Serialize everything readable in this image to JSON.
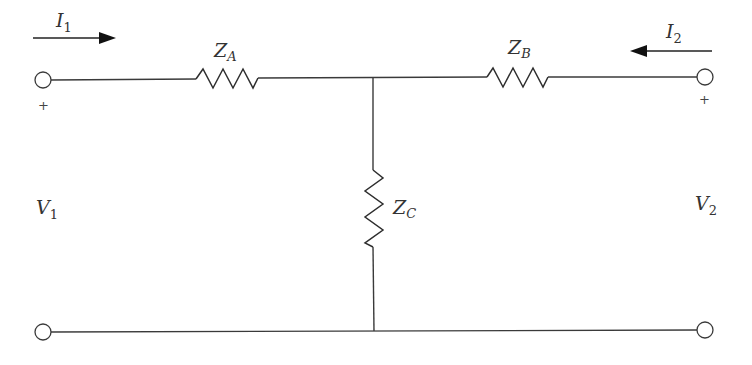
{
  "diagram": {
    "type": "two-port T-network",
    "currents": {
      "i1": {
        "symbol": "I",
        "subscript": "1",
        "direction": "right"
      },
      "i2": {
        "symbol": "I",
        "subscript": "2",
        "direction": "left"
      }
    },
    "impedances": {
      "za": {
        "symbol": "Z",
        "subscript": "A",
        "orientation": "horizontal"
      },
      "zb": {
        "symbol": "Z",
        "subscript": "B",
        "orientation": "horizontal"
      },
      "zc": {
        "symbol": "Z",
        "subscript": "C",
        "orientation": "vertical"
      }
    },
    "voltages": {
      "v1": {
        "symbol": "V",
        "subscript": "1"
      },
      "v2": {
        "symbol": "V",
        "subscript": "2"
      }
    },
    "polarity": {
      "left_plus": "+",
      "right_plus": "+"
    },
    "colors": {
      "wire": "#3a3a3a",
      "background": "#ffffff"
    }
  }
}
